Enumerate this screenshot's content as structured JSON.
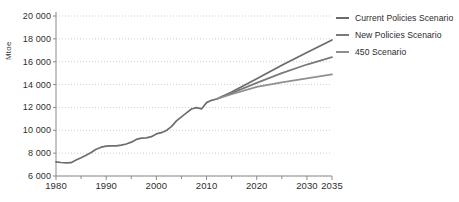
{
  "chart_data": {
    "type": "line",
    "title": "",
    "xlabel": "",
    "ylabel": "Mtoe",
    "xlim": [
      1980,
      2035
    ],
    "ylim": [
      6000,
      20000
    ],
    "grid": true,
    "legend_position": "right",
    "ytick_labels": [
      "20 000",
      "18 000",
      "16 000",
      "14 000",
      "12 000",
      "10 000",
      "8 000",
      "6 000"
    ],
    "ytick_values": [
      20000,
      18000,
      16000,
      14000,
      12000,
      10000,
      8000,
      6000
    ],
    "xtick_labels": [
      "1980",
      "1990",
      "2000",
      "2010",
      "2020",
      "2030",
      "2035"
    ],
    "xtick_values": [
      1980,
      1990,
      2000,
      2010,
      2020,
      2030,
      2035
    ],
    "xminor_ticks": [
      1985,
      1995,
      2005,
      2015,
      2025
    ],
    "series": [
      {
        "name": "Historical",
        "color": "#6e6e6e",
        "in_legend": false,
        "x": [
          1980,
          1981,
          1982,
          1983,
          1984,
          1985,
          1986,
          1987,
          1988,
          1989,
          1990,
          1991,
          1992,
          1993,
          1994,
          1995,
          1996,
          1997,
          1998,
          1999,
          2000,
          2001,
          2002,
          2003,
          2004,
          2005,
          2006,
          2007,
          2008,
          2009,
          2010,
          2011,
          2012
        ],
        "values": [
          7230,
          7180,
          7150,
          7170,
          7400,
          7600,
          7820,
          8060,
          8340,
          8520,
          8620,
          8640,
          8630,
          8700,
          8800,
          8960,
          9200,
          9320,
          9340,
          9440,
          9680,
          9790,
          9980,
          10320,
          10820,
          11180,
          11520,
          11860,
          11980,
          11870,
          12420,
          12620,
          12740
        ]
      },
      {
        "name": "Current Policies Scenario",
        "color": "#6b6b6b",
        "in_legend": true,
        "x": [
          2012,
          2015,
          2020,
          2025,
          2030,
          2035
        ],
        "values": [
          12740,
          13350,
          14500,
          15700,
          16800,
          17900
        ]
      },
      {
        "name": "New Policies Scenario",
        "color": "#7a7a7a",
        "in_legend": true,
        "x": [
          2012,
          2015,
          2020,
          2025,
          2030,
          2035
        ],
        "values": [
          12740,
          13250,
          14150,
          15000,
          15750,
          16400
        ]
      },
      {
        "name": "450 Scenario",
        "color": "#8f8f8f",
        "in_legend": true,
        "x": [
          2012,
          2015,
          2020,
          2025,
          2030,
          2035
        ],
        "values": [
          12740,
          13150,
          13800,
          14200,
          14550,
          14900
        ]
      }
    ]
  },
  "legend": {
    "items": [
      {
        "label": "Current Policies Scenario",
        "color": "#6b6b6b"
      },
      {
        "label": "New Policies Scenario",
        "color": "#7a7a7a"
      },
      {
        "label": "450 Scenario",
        "color": "#8f8f8f"
      }
    ]
  },
  "axis": {
    "y_unit_label": "Mtoe"
  }
}
